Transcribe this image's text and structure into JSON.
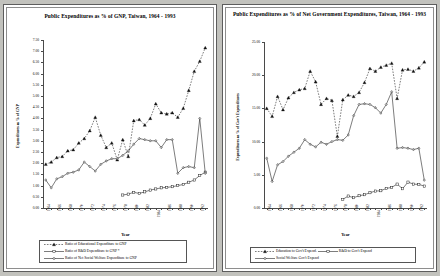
{
  "chart_data": [
    {
      "type": "line",
      "panel": "left",
      "title": "Public Expenditures as % of GNP, Taiwan, 1964 - 1993",
      "xlabel": "Year",
      "ylabel": "Expenditures as % of GNP",
      "ylim": [
        0.0,
        7.5
      ],
      "ytick_step": 0.5,
      "ytick_labels": [
        "0.00",
        "0.50",
        "1.00",
        "1.50",
        "2.00",
        "2.50",
        "3.00",
        "3.50",
        "4.00",
        "4.50",
        "5.00",
        "5.50",
        "6.00",
        "6.50",
        "7.00",
        "7.50"
      ],
      "grid": false,
      "legend_position": "bottom",
      "x": [
        1964,
        1965,
        1966,
        1967,
        1968,
        1969,
        1970,
        1971,
        1972,
        1973,
        1974,
        1975,
        1976,
        1977,
        1978,
        1979,
        1980,
        1981,
        1982,
        1983,
        1984,
        1985,
        1986,
        1987,
        1988,
        1989,
        1990,
        1991,
        1992,
        1993
      ],
      "xtick_labels": [
        "1964",
        "1965",
        "1966",
        "1967",
        "1968",
        "1969",
        "1970",
        "1971",
        "1972",
        "1973",
        "1974",
        "1975",
        "1976",
        "1977",
        "1978",
        "1979",
        "1980",
        "1981",
        "1982",
        "1983",
        "1984",
        "1985",
        "1986",
        "1987",
        "1988",
        "1989",
        "1990",
        "1991",
        "1992",
        "1993"
      ],
      "xtick_shown": [
        "1964",
        "1966",
        "1968",
        "1970",
        "1972",
        "1974",
        "1976",
        "1978",
        "1980",
        "1982",
        "1984",
        "1986",
        "1988",
        "1990",
        "1992"
      ],
      "series": [
        {
          "name": "Ratio of Educational Expenditure to GNP",
          "marker": "triangle",
          "line": "dashed",
          "values": [
            1.95,
            2.05,
            2.25,
            2.3,
            2.55,
            2.6,
            2.9,
            3.1,
            3.45,
            4.05,
            3.25,
            2.7,
            2.9,
            2.15,
            3.05,
            2.3,
            3.9,
            3.95,
            3.7,
            4.0,
            4.65,
            4.25,
            4.2,
            4.25,
            4.05,
            4.45,
            5.25,
            6.1,
            6.55,
            7.15
          ]
        },
        {
          "name": "Ratio of R&D  Expenditure to GNP *",
          "marker": "square",
          "line": "solid",
          "values": [
            null,
            null,
            null,
            null,
            null,
            null,
            null,
            null,
            null,
            null,
            null,
            null,
            null,
            null,
            0.58,
            0.62,
            0.7,
            0.65,
            0.72,
            0.8,
            0.85,
            0.9,
            0.92,
            0.95,
            1.0,
            1.05,
            1.15,
            1.25,
            1.45,
            1.6
          ]
        },
        {
          "name": "Ratio of Net Social Welfare Expenditure to GNP",
          "marker": "diamond",
          "line": "solid",
          "values": [
            1.25,
            0.9,
            1.3,
            1.4,
            1.55,
            1.6,
            1.7,
            2.05,
            1.85,
            1.65,
            1.95,
            2.1,
            2.2,
            2.2,
            2.35,
            2.55,
            2.85,
            3.1,
            3.05,
            3.0,
            3.0,
            2.7,
            3.05,
            3.05,
            1.55,
            1.8,
            1.85,
            1.8,
            4.0,
            1.55
          ]
        }
      ]
    },
    {
      "type": "line",
      "panel": "right",
      "title": "Public Expenditures as % of Net Government Expenditures, Taiwan, 1964 - 1993",
      "xlabel": "Year",
      "ylabel": "Expenditures as % of Gov't Expenditures",
      "ylim": [
        0.0,
        25.0
      ],
      "ytick_step": 5.0,
      "ytick_labels": [
        "0.00",
        "5.00",
        "10.00",
        "15.00",
        "20.00",
        "25.00"
      ],
      "grid": false,
      "legend_position": "bottom",
      "x": [
        1964,
        1965,
        1966,
        1967,
        1968,
        1969,
        1970,
        1971,
        1972,
        1973,
        1974,
        1975,
        1976,
        1977,
        1978,
        1979,
        1980,
        1981,
        1982,
        1983,
        1984,
        1985,
        1986,
        1987,
        1988,
        1989,
        1990,
        1991,
        1992,
        1993
      ],
      "xtick_labels": [
        "1964",
        "1965",
        "1966",
        "1967",
        "1968",
        "1969",
        "1970",
        "1971",
        "1972",
        "1973",
        "1974",
        "1975",
        "1976",
        "1977",
        "1978",
        "1979",
        "1980",
        "1981",
        "1982",
        "1983",
        "1984",
        "1985",
        "1986",
        "1987",
        "1988",
        "1989",
        "1990",
        "1991",
        "1992",
        "1993"
      ],
      "xtick_shown": [
        "1964",
        "1966",
        "1968",
        "1970",
        "1972",
        "1974",
        "1976",
        "1978",
        "1980",
        "1982",
        "1984",
        "1986",
        "1988",
        "1990",
        "1992"
      ],
      "series": [
        {
          "name": "Education to  Gov't Expend.",
          "marker": "triangle",
          "line": "dashed",
          "values": [
            15.0,
            13.8,
            16.8,
            14.8,
            16.6,
            17.4,
            17.8,
            18.0,
            20.6,
            19.0,
            15.6,
            16.5,
            16.2,
            10.8,
            16.3,
            17.0,
            16.8,
            17.4,
            18.9,
            21.0,
            20.6,
            21.2,
            21.5,
            21.8,
            16.5,
            20.8,
            20.9,
            20.6,
            21.1,
            22.0
          ]
        },
        {
          "name": "R&D to  Gov't Expend",
          "marker": "square",
          "line": "solid",
          "values": [
            null,
            null,
            null,
            null,
            null,
            null,
            null,
            null,
            null,
            null,
            null,
            null,
            null,
            null,
            1.3,
            1.8,
            1.55,
            1.85,
            2.0,
            2.3,
            2.55,
            2.6,
            2.95,
            3.1,
            3.6,
            2.9,
            3.9,
            3.6,
            3.55,
            3.3
          ]
        },
        {
          "name": "Social Welfare Gov't Expend",
          "marker": "diamond",
          "line": "solid",
          "values": [
            7.5,
            4.0,
            6.5,
            7.0,
            7.8,
            8.4,
            9.0,
            10.3,
            9.6,
            9.2,
            9.9,
            9.6,
            10.0,
            10.3,
            10.2,
            11.0,
            13.9,
            15.6,
            15.7,
            15.6,
            15.1,
            14.3,
            15.6,
            17.5,
            9.0,
            9.1,
            9.0,
            8.8,
            9.0,
            4.2
          ]
        }
      ]
    }
  ]
}
